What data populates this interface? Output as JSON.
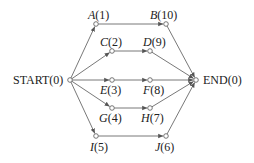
{
  "diagram": {
    "type": "network",
    "nodes": [
      {
        "id": "START",
        "letter": "START",
        "value": "(0)",
        "x": 70,
        "y": 80
      },
      {
        "id": "A",
        "letter": "A",
        "value": "(1)",
        "x": 96,
        "y": 24
      },
      {
        "id": "B",
        "letter": "B",
        "value": "(10)",
        "x": 166,
        "y": 24
      },
      {
        "id": "C",
        "letter": "C",
        "value": "(2)",
        "x": 112,
        "y": 51
      },
      {
        "id": "D",
        "letter": "D",
        "value": "(9)",
        "x": 150,
        "y": 51
      },
      {
        "id": "E",
        "letter": "E",
        "value": "(3)",
        "x": 112,
        "y": 80
      },
      {
        "id": "F",
        "letter": "F",
        "value": "(8)",
        "x": 150,
        "y": 80
      },
      {
        "id": "G",
        "letter": "G",
        "value": "(4)",
        "x": 112,
        "y": 108
      },
      {
        "id": "H",
        "letter": "H",
        "value": "(7)",
        "x": 150,
        "y": 108
      },
      {
        "id": "I",
        "letter": "I",
        "value": "(5)",
        "x": 96,
        "y": 136
      },
      {
        "id": "J",
        "letter": "J",
        "value": "(6)",
        "x": 166,
        "y": 136
      },
      {
        "id": "END",
        "letter": "END",
        "value": "(0)",
        "x": 196,
        "y": 80
      }
    ],
    "edges": [
      [
        "START",
        "A"
      ],
      [
        "START",
        "C"
      ],
      [
        "START",
        "E"
      ],
      [
        "START",
        "G"
      ],
      [
        "START",
        "I"
      ],
      [
        "A",
        "B"
      ],
      [
        "C",
        "D"
      ],
      [
        "E",
        "F"
      ],
      [
        "G",
        "H"
      ],
      [
        "I",
        "J"
      ],
      [
        "B",
        "END"
      ],
      [
        "D",
        "END"
      ],
      [
        "F",
        "END"
      ],
      [
        "H",
        "END"
      ],
      [
        "J",
        "END"
      ]
    ],
    "labels": {
      "start": {
        "name": "START",
        "value": "(0)"
      },
      "a": {
        "name": "A",
        "value": "(1)"
      },
      "b": {
        "name": "B",
        "value": "(10)"
      },
      "c": {
        "name": "C",
        "value": "(2)"
      },
      "d": {
        "name": "D",
        "value": "(9)"
      },
      "e": {
        "name": "E",
        "value": "(3)"
      },
      "f": {
        "name": "F",
        "value": "(8)"
      },
      "g": {
        "name": "G",
        "value": "(4)"
      },
      "h": {
        "name": "H",
        "value": "(7)"
      },
      "i": {
        "name": "I",
        "value": "(5)"
      },
      "j": {
        "name": "J",
        "value": "(6)"
      },
      "end": {
        "name": "END",
        "value": "(0)"
      }
    },
    "colors": {
      "line": "#555555",
      "node_fill": "#ffffff",
      "text": "#222222"
    }
  }
}
